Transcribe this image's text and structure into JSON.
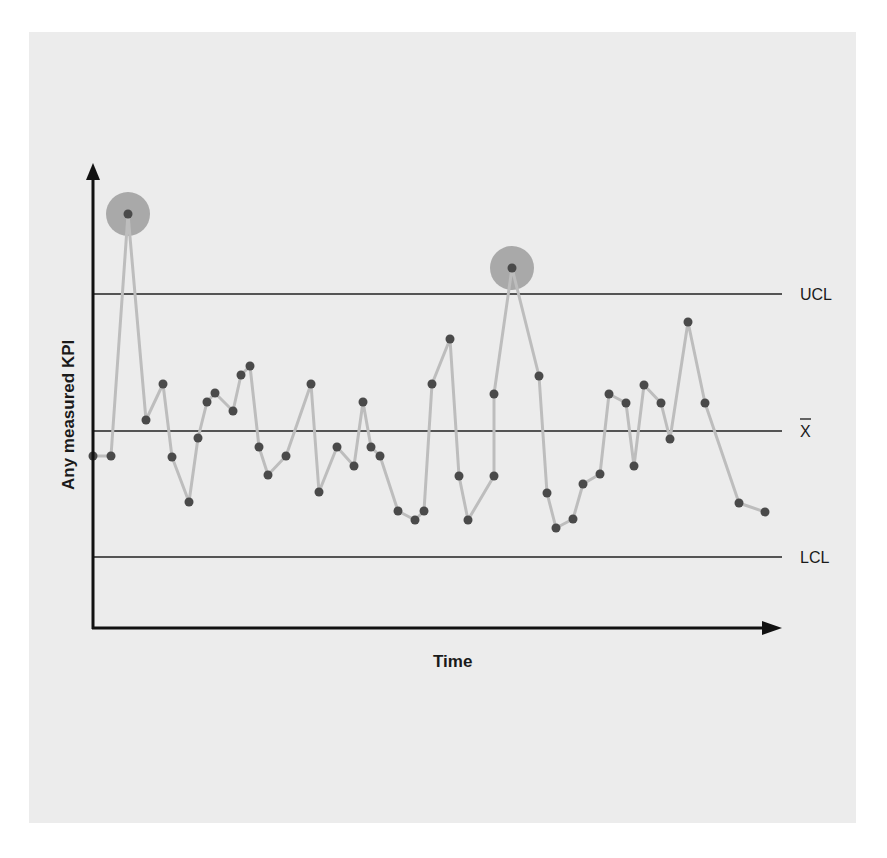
{
  "chart_data": {
    "type": "line",
    "title": "",
    "subtitle": "",
    "chart_kind": "control chart (statistical process control)",
    "xlabel": "Time",
    "ylabel": "Any measured KPI",
    "grid": false,
    "legend": "none",
    "x_tick_labels": [],
    "y_tick_labels": [],
    "reference_lines": [
      {
        "name": "UCL",
        "label": "UCL",
        "pixel_y": 294
      },
      {
        "name": "mean",
        "label": "X̄",
        "pixel_y": 431
      },
      {
        "name": "LCL",
        "label": "LCL",
        "pixel_y": 557
      }
    ],
    "series": [
      {
        "name": "KPI measurements",
        "points": [
          [
            93,
            456
          ],
          [
            111,
            456
          ],
          [
            128,
            214
          ],
          [
            146,
            420
          ],
          [
            163,
            384
          ],
          [
            172,
            457
          ],
          [
            189,
            502
          ],
          [
            198,
            438
          ],
          [
            207,
            402
          ],
          [
            215,
            393
          ],
          [
            233,
            411
          ],
          [
            241,
            375
          ],
          [
            250,
            366
          ],
          [
            259,
            447
          ],
          [
            268,
            475
          ],
          [
            286,
            456
          ],
          [
            311,
            384
          ],
          [
            319,
            492
          ],
          [
            337,
            447
          ],
          [
            354,
            466
          ],
          [
            363,
            402
          ],
          [
            371,
            447
          ],
          [
            380,
            456
          ],
          [
            398,
            511
          ],
          [
            415,
            520
          ],
          [
            424,
            511
          ],
          [
            432,
            384
          ],
          [
            450,
            339
          ],
          [
            459,
            476
          ],
          [
            468,
            520
          ],
          [
            494,
            476
          ],
          [
            494,
            394
          ],
          [
            512,
            268
          ],
          [
            539,
            376
          ],
          [
            547,
            493
          ],
          [
            556,
            528
          ],
          [
            573,
            519
          ],
          [
            583,
            484
          ],
          [
            600,
            474
          ],
          [
            609,
            394
          ],
          [
            626,
            403
          ],
          [
            634,
            466
          ],
          [
            644,
            385
          ],
          [
            661,
            403
          ],
          [
            670,
            439
          ],
          [
            688,
            322
          ],
          [
            705,
            403
          ],
          [
            739,
            503
          ],
          [
            765,
            512
          ]
        ]
      }
    ],
    "highlighted_outliers": [
      {
        "index": 2,
        "pixel": [
          128,
          214
        ],
        "note": "above UCL"
      },
      {
        "index": 32,
        "pixel": [
          512,
          268
        ],
        "note": "above UCL"
      }
    ],
    "colors": {
      "background_panel": "#ececec",
      "axis": "#111111",
      "control_lines": "#222222",
      "data_line": "#bdbdbd",
      "data_point": "#4a4a4a",
      "outlier_halo": "#a9a9a9"
    }
  },
  "labels": {
    "x_axis": "Time",
    "y_axis": "Any measured KPI",
    "ucl": "UCL",
    "mean": "X",
    "lcl": "LCL"
  }
}
